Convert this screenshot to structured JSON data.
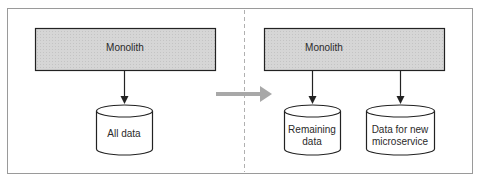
{
  "diagram": {
    "before": {
      "service_label": "Monolith",
      "database_label": "All data"
    },
    "after": {
      "service_label": "Monolith",
      "databases": [
        {
          "label": "Remaining\ndata"
        },
        {
          "label": "Data for new\nmicroservice"
        }
      ]
    },
    "colors": {
      "box_fill": "#d9d9d9",
      "stroke": "#222222",
      "transition_arrow": "#a8a8a8",
      "frame": "#9a9a9a"
    }
  }
}
